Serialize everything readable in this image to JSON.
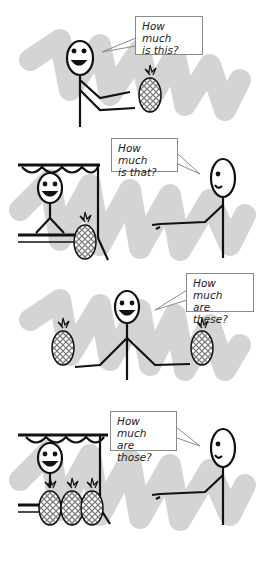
{
  "panels": [
    {
      "id": "this",
      "bubble": {
        "line1": "How much",
        "line2": "is this?"
      },
      "pineapple_count": 1,
      "has_stall": false
    },
    {
      "id": "that",
      "bubble": {
        "line1": "How much",
        "line2": "is that?"
      },
      "pineapple_count": 1,
      "has_stall": true
    },
    {
      "id": "these",
      "bubble": {
        "line1": "How much",
        "line2": "are these?"
      },
      "pineapple_count": 2,
      "has_stall": false
    },
    {
      "id": "those",
      "bubble": {
        "line1": "How much",
        "line2": "are those?"
      },
      "pineapple_count": 3,
      "has_stall": true
    }
  ],
  "colors": {
    "scribble": "#c8c8c8",
    "line": "#111111",
    "bubble_border": "#8a8a8a"
  }
}
